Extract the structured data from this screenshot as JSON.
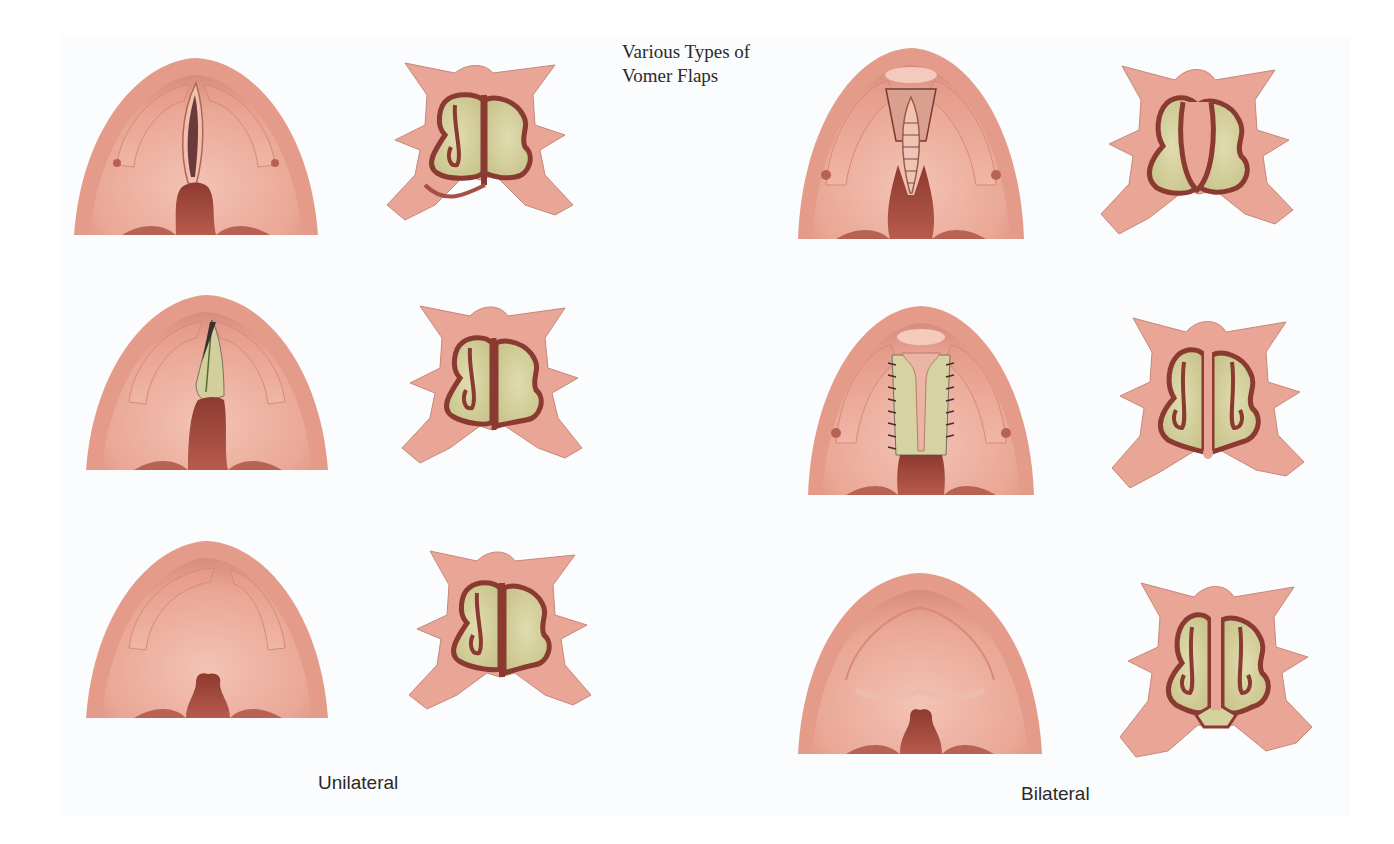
{
  "title": {
    "line1": "Various Types of",
    "line2": "Vomer Flaps"
  },
  "columns": [
    {
      "label": "Unilateral",
      "figures": [
        {
          "type": "palate-view",
          "variant": "unilateral-flap-raised"
        },
        {
          "type": "nasal-cross-section",
          "variant": "unilateral-flap-raised"
        },
        {
          "type": "palate-view",
          "variant": "unilateral-flap-turned"
        },
        {
          "type": "nasal-cross-section",
          "variant": "unilateral-flap-turned"
        },
        {
          "type": "palate-view",
          "variant": "unilateral-healed"
        },
        {
          "type": "nasal-cross-section",
          "variant": "unilateral-healed"
        }
      ]
    },
    {
      "label": "Bilateral",
      "figures": [
        {
          "type": "palate-view",
          "variant": "bilateral-flap-sutured-midline"
        },
        {
          "type": "nasal-cross-section",
          "variant": "bilateral-flap-raised"
        },
        {
          "type": "palate-view",
          "variant": "bilateral-flaps-sutured-lateral"
        },
        {
          "type": "nasal-cross-section",
          "variant": "bilateral-flaps-turned"
        },
        {
          "type": "palate-view",
          "variant": "bilateral-healed"
        },
        {
          "type": "nasal-cross-section",
          "variant": "bilateral-healed"
        }
      ]
    }
  ],
  "colors": {
    "tissue": "#e8a394",
    "tissue_light": "#f2c0b3",
    "tissue_dark": "#c9776a",
    "mucosa_line": "#8a3a30",
    "cleft_dark": "#a4493e",
    "nasal_cavity": "#d6d2a0",
    "background": "#fbfcfd",
    "text": "#2a2a2a"
  }
}
